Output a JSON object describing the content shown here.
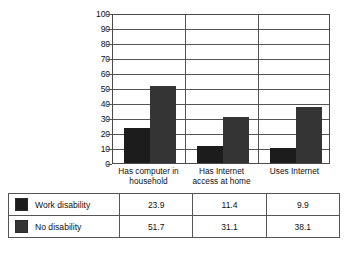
{
  "chart_data": {
    "type": "bar",
    "title": "",
    "subtitle": "",
    "xlabel": "",
    "ylabel": "",
    "ylim": [
      0,
      100
    ],
    "ytick_step": 10,
    "yticks": [
      "100",
      "90",
      "80",
      "70",
      "60",
      "50",
      "40",
      "30",
      "20",
      "10",
      "0"
    ],
    "grid": true,
    "legend_position": "table-below",
    "categories": [
      "Has computer in household",
      "Has Internet access at home",
      "Uses Internet"
    ],
    "category_lines": [
      [
        "Has computer in",
        "household"
      ],
      [
        "Has Internet",
        "access at home"
      ],
      [
        "Uses Internet"
      ]
    ],
    "series": [
      {
        "name": "Work disability",
        "values": [
          23.9,
          11.4,
          9.9
        ],
        "color": "#1c1c1c"
      },
      {
        "name": "No disability",
        "values": [
          51.7,
          31.1,
          38.1
        ],
        "color": "#343434"
      }
    ]
  },
  "table": {
    "rows": [
      {
        "label": "Work disability",
        "swatch_color": "#1c1c1c",
        "values": [
          "23.9",
          "11.4",
          "9.9"
        ]
      },
      {
        "label": "No disability",
        "swatch_color": "#343434",
        "values": [
          "51.7",
          "31.1",
          "38.1"
        ]
      }
    ]
  }
}
